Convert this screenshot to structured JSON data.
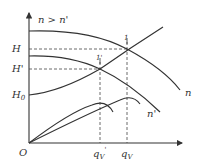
{
  "diagram": {
    "condition_label": "n > n'",
    "y_axis_labels": {
      "H": "H",
      "H_prime": "H'",
      "H0": "H",
      "H0_sub": "0"
    },
    "x_axis_labels": {
      "origin": "O",
      "qV_prime": "q",
      "qV_prime_sub": "V",
      "qV_prime_mark": "'",
      "qV": "q",
      "qV_sub": "V"
    },
    "curve_labels": {
      "n": "n",
      "n_prime": "n'"
    },
    "point_labels": {
      "point_1": "1",
      "point_1_prime": "1'"
    },
    "colors": {
      "line": "#333333",
      "background": "#ffffff"
    }
  }
}
